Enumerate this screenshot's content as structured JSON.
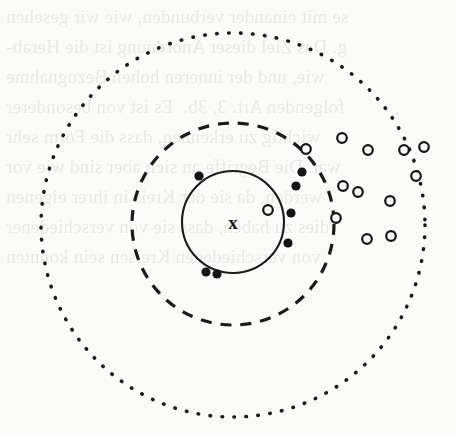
{
  "figure": {
    "caption": "",
    "width": 456,
    "height": 437,
    "background_color": "#fbfbf9",
    "ink_color": "#1a1a1a"
  },
  "ghost_text": {
    "description": "faint show-through text from the reverse side of the page",
    "lines": [
      {
        "text": "se mit einander verbunden, wie wir gesehen",
        "top": 2
      },
      {
        "text": "g. Das Ziel dieser Anordnung ist die Herab-",
        "top": 32
      },
      {
        "text": "wie, und der inneren hohen Bezugnahme",
        "top": 62
      },
      {
        "text": "folgenden Art. 3, 3b.  Es ist von besonderer",
        "top": 92
      },
      {
        "text": "wichtig zu erkennen, dass die Form sehr",
        "top": 122
      },
      {
        "text": "war. Die Begriffe an sich aber sind wie vor",
        "top": 152
      },
      {
        "text": "werden, da sie der Kreis in ihrer eigenen",
        "top": 182
      },
      {
        "text": "dies zu haben, dass sie von verschiedener",
        "top": 212
      },
      {
        "text": "von verschiedenen Kreisen sein konnten",
        "top": 242
      }
    ]
  },
  "chart_data": {
    "type": "scatter",
    "title": "",
    "xlabel": "",
    "ylabel": "",
    "xlim": [
      0,
      456
    ],
    "ylim": [
      437,
      0
    ],
    "grid": false,
    "legend_position": "none",
    "axes_visible": false,
    "center": {
      "x": 233,
      "y": 222,
      "label": "x",
      "marker": "x-cross"
    },
    "boundaries": [
      {
        "name": "inner-circle",
        "style": "solid",
        "cx": 233,
        "cy": 222,
        "r": 51,
        "stroke_width": 2.1,
        "color": "#1a1a1a"
      },
      {
        "name": "middle-circle",
        "style": "dashed",
        "cx": 233,
        "cy": 224,
        "r": 101,
        "stroke_width": 3.2,
        "dash": "11 9",
        "color": "#1a1a1a"
      },
      {
        "name": "outer-circle",
        "style": "dotted",
        "cx": 233,
        "cy": 225,
        "r": 192,
        "stroke_width": 3.6,
        "dash": "0.5 11.5",
        "color": "#1a1a1a"
      }
    ],
    "series": [
      {
        "name": "filled-markers",
        "marker": "filled-circle",
        "marker_size": 4.6,
        "fill": "#151515",
        "stroke": "#151515",
        "count": 7,
        "points": [
          {
            "x": 199,
            "y": 176
          },
          {
            "x": 291,
            "y": 213
          },
          {
            "x": 288,
            "y": 243
          },
          {
            "x": 206,
            "y": 272
          },
          {
            "x": 217,
            "y": 274
          },
          {
            "x": 302,
            "y": 172
          },
          {
            "x": 296,
            "y": 186
          }
        ]
      },
      {
        "name": "open-markers",
        "marker": "open-circle",
        "marker_size": 4.8,
        "fill": "#fbfbf9",
        "stroke": "#151515",
        "stroke_width": 2.2,
        "count": 13,
        "points": [
          {
            "x": 268,
            "y": 210
          },
          {
            "x": 306,
            "y": 149
          },
          {
            "x": 342,
            "y": 138
          },
          {
            "x": 368,
            "y": 150
          },
          {
            "x": 404,
            "y": 150
          },
          {
            "x": 416,
            "y": 176
          },
          {
            "x": 343,
            "y": 186
          },
          {
            "x": 358,
            "y": 192
          },
          {
            "x": 390,
            "y": 201
          },
          {
            "x": 367,
            "y": 239
          },
          {
            "x": 391,
            "y": 236
          },
          {
            "x": 424,
            "y": 147
          },
          {
            "x": 336,
            "y": 218
          }
        ]
      }
    ]
  }
}
